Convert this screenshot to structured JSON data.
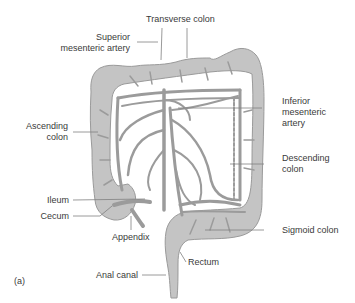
{
  "figure": {
    "panel_label": "(a)",
    "colors": {
      "colon_fill": "#c4c4c4",
      "colon_stroke": "#9a9a9a",
      "vessel": "#9b9b9b",
      "label_text": "#3a3a3a",
      "leader_line": "#808080",
      "background": "#ffffff"
    },
    "labels": {
      "transverse_colon": "Transverse colon",
      "superior_mesenteric_artery_line1": "Superior",
      "superior_mesenteric_artery_line2": "mesenteric artery",
      "inferior_mesenteric_artery_line1": "Inferior",
      "inferior_mesenteric_artery_line2": "mesenteric",
      "inferior_mesenteric_artery_line3": "artery",
      "ascending_colon_line1": "Ascending",
      "ascending_colon_line2": "colon",
      "descending_colon_line1": "Descending",
      "descending_colon_line2": "colon",
      "ileum": "Ileum",
      "cecum": "Cecum",
      "appendix": "Appendix",
      "sigmoid_colon": "Sigmoid colon",
      "rectum": "Rectum",
      "anal_canal": "Anal canal"
    }
  }
}
